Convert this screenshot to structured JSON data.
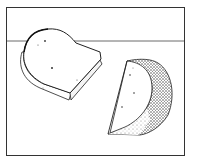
{
  "illustration": {
    "subject": "two pieces of cheese",
    "items": [
      {
        "name": "cheese-block",
        "description": "rounded cheese slab with holes"
      },
      {
        "name": "cheese-wedge",
        "description": "wedge of round cheese with stippled rind"
      }
    ],
    "colors": {
      "ink": "#222222",
      "background": "#ffffff",
      "frame": "#333333"
    }
  }
}
